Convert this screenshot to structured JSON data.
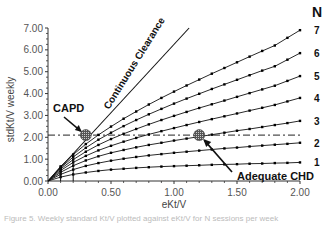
{
  "chart_data": {
    "type": "line",
    "title": "",
    "xlabel": "eKt/V",
    "ylabel": "stdKt/V weekly",
    "xlim": [
      0,
      2.0
    ],
    "ylim": [
      0,
      7.0
    ],
    "x_ticks": [
      "0.00",
      "0.50",
      "1.00",
      "1.50",
      "2.00"
    ],
    "y_ticks": [
      "0.00",
      "1.00",
      "2.00",
      "3.00",
      "4.00",
      "5.00",
      "6.00",
      "7.00"
    ],
    "grid": false,
    "legend_title": "N",
    "legend_position": "right",
    "x": [
      0.1,
      0.2,
      0.3,
      0.4,
      0.5,
      0.6,
      0.7,
      0.8,
      0.9,
      1.0,
      1.1,
      1.2,
      1.3,
      1.4,
      1.5,
      1.6,
      1.7,
      1.8,
      1.9,
      2.0
    ],
    "series": [
      {
        "name": "1",
        "values": [
          0.18,
          0.3,
          0.39,
          0.46,
          0.52,
          0.56,
          0.6,
          0.63,
          0.66,
          0.68,
          0.7,
          0.72,
          0.74,
          0.76,
          0.77,
          0.79,
          0.8,
          0.82,
          0.83,
          0.85
        ]
      },
      {
        "name": "2",
        "values": [
          0.3,
          0.52,
          0.69,
          0.82,
          0.93,
          1.02,
          1.1,
          1.17,
          1.23,
          1.29,
          1.34,
          1.39,
          1.44,
          1.49,
          1.53,
          1.58,
          1.62,
          1.66,
          1.7,
          1.75
        ]
      },
      {
        "name": "3",
        "values": [
          0.4,
          0.7,
          0.94,
          1.13,
          1.29,
          1.42,
          1.54,
          1.65,
          1.75,
          1.85,
          1.94,
          2.03,
          2.12,
          2.21,
          2.3,
          2.38,
          2.47,
          2.56,
          2.65,
          2.75
        ]
      },
      {
        "name": "4",
        "values": [
          0.48,
          0.85,
          1.15,
          1.4,
          1.61,
          1.8,
          1.97,
          2.13,
          2.28,
          2.42,
          2.56,
          2.7,
          2.83,
          2.96,
          3.09,
          3.22,
          3.35,
          3.48,
          3.64,
          3.8
        ]
      },
      {
        "name": "5",
        "values": [
          0.55,
          0.98,
          1.34,
          1.65,
          1.92,
          2.16,
          2.38,
          2.59,
          2.79,
          2.98,
          3.16,
          3.34,
          3.51,
          3.68,
          3.85,
          4.02,
          4.19,
          4.36,
          4.58,
          4.8
        ]
      },
      {
        "name": "6",
        "values": [
          0.61,
          1.1,
          1.52,
          1.89,
          2.21,
          2.51,
          2.79,
          3.05,
          3.3,
          3.54,
          3.77,
          3.99,
          4.21,
          4.42,
          4.63,
          4.84,
          5.05,
          5.25,
          5.55,
          5.85
        ]
      },
      {
        "name": "7",
        "values": [
          0.67,
          1.21,
          1.69,
          2.11,
          2.49,
          2.85,
          3.18,
          3.5,
          3.8,
          4.09,
          4.37,
          4.64,
          4.91,
          5.17,
          5.43,
          5.69,
          5.95,
          6.2,
          6.55,
          6.9
        ]
      }
    ],
    "reference_lines": [
      {
        "name": "Continuous Clearance",
        "type": "line",
        "points": [
          [
            0,
            0
          ],
          [
            1.12,
            7.0
          ]
        ]
      },
      {
        "name": "Adequate target",
        "type": "horizontal-dashdot",
        "y": 2.1,
        "x_range": [
          0,
          2.0
        ]
      }
    ],
    "annotations": [
      {
        "text": "CAPD",
        "x": 0.3,
        "y": 2.1,
        "marker": "hatched-circle"
      },
      {
        "text": "Adequate CHD",
        "x": 1.2,
        "y": 2.1,
        "marker": "hatched-circle"
      },
      {
        "text": "Continuous Clearance",
        "rotated": true
      }
    ]
  },
  "labels": {
    "legend_title": "N",
    "xlabel": "eKt/V",
    "ylabel": "stdKt/V weekly",
    "capd": "CAPD",
    "adequate_chd": "Adequate CHD",
    "continuous_clearance": "Continuous Clearance",
    "caption": "Figure 5. Weekly standard Kt/V plotted against eKt/V for N sessions per week"
  }
}
